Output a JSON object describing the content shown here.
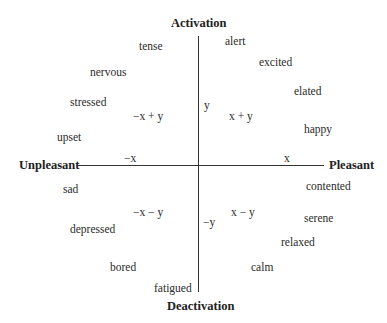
{
  "axes": {
    "top": "Activation",
    "bottom": "Deactivation",
    "left": "Unpleasant",
    "right": "Pleasant"
  },
  "vectors": {
    "y": "y",
    "neg_y": "−y",
    "x": "x",
    "neg_x": "−x",
    "x_plus_y": "x + y",
    "negx_plus_y": "−x + y",
    "x_minus_y": "x − y",
    "negx_minus_y": "−x − y"
  },
  "emotions": {
    "tense": "tense",
    "alert": "alert",
    "nervous": "nervous",
    "excited": "excited",
    "stressed": "stressed",
    "elated": "elated",
    "upset": "upset",
    "happy": "happy",
    "sad": "sad",
    "contented": "contented",
    "depressed": "depressed",
    "serene": "serene",
    "relaxed": "relaxed",
    "bored": "bored",
    "calm": "calm",
    "fatigued": "fatigued"
  }
}
